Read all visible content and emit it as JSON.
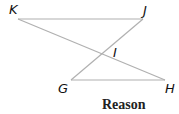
{
  "diagram": {
    "points": {
      "K": {
        "label": "K",
        "x": 18,
        "y": 19
      },
      "J": {
        "label": "J",
        "x": 143,
        "y": 19
      },
      "I": {
        "label": "I",
        "x": 104,
        "y": 53
      },
      "G": {
        "label": "G",
        "x": 71,
        "y": 80
      },
      "H": {
        "label": "H",
        "x": 165,
        "y": 80
      }
    },
    "segments": [
      [
        "K",
        "J"
      ],
      [
        "K",
        "H"
      ],
      [
        "J",
        "G"
      ],
      [
        "G",
        "H"
      ]
    ],
    "line_color": "#b0b0b0"
  },
  "footer": {
    "reason_label": "Reason"
  }
}
